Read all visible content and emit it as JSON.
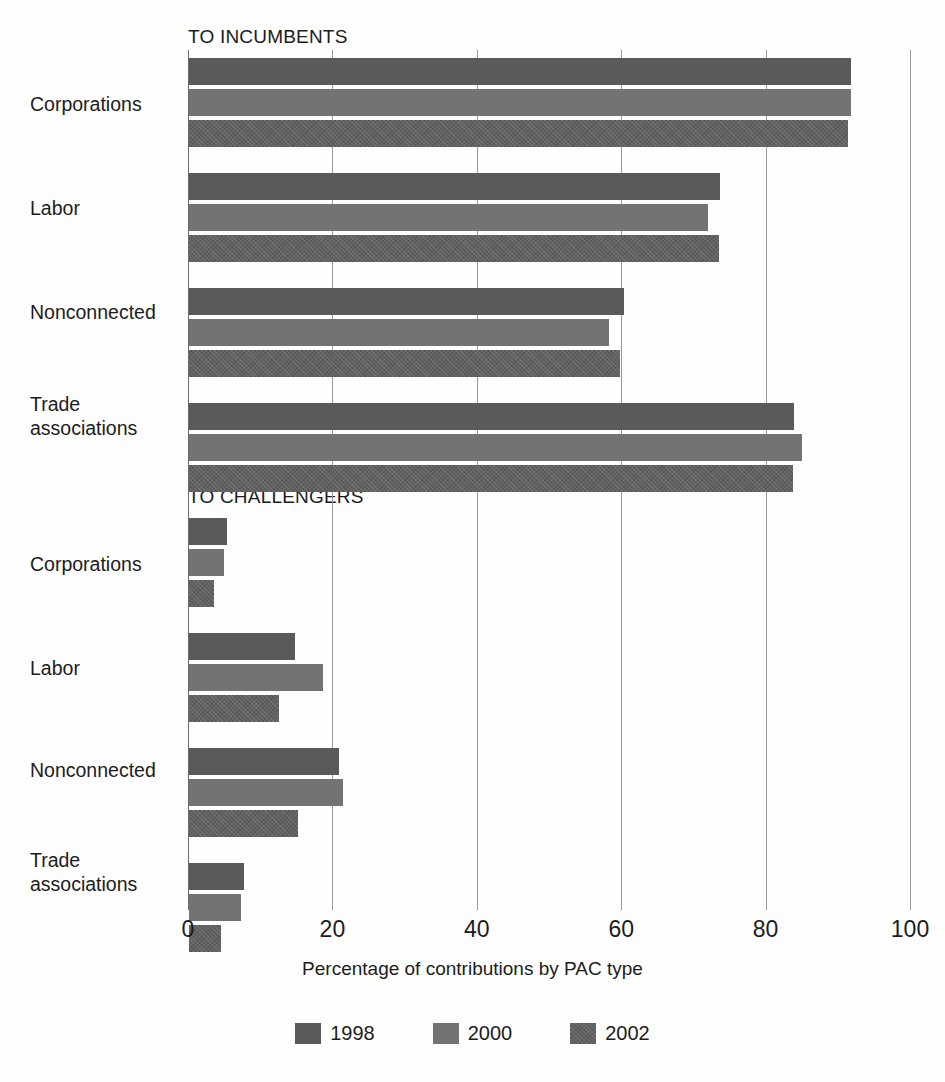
{
  "chart_data": {
    "type": "bar",
    "orientation": "horizontal",
    "title": "",
    "xlabel": "Percentage of contributions by PAC type",
    "ylabel": "",
    "xlim": [
      0,
      100
    ],
    "xticks": [
      0,
      20,
      40,
      60,
      80,
      100
    ],
    "grid": true,
    "legend_position": "bottom",
    "series": [
      {
        "name": "1998",
        "color": "#5a5a5a"
      },
      {
        "name": "2000",
        "color": "#737373"
      },
      {
        "name": "2002",
        "color": "#616161"
      }
    ],
    "panels": [
      {
        "heading": "TO INCUMBENTS",
        "categories": [
          "Corporations",
          "Labor",
          "Nonconnected",
          "Trade associations"
        ],
        "values": {
          "1998": [
            91.7,
            73.5,
            60.2,
            83.8
          ],
          "2000": [
            91.7,
            71.9,
            58.2,
            84.9
          ],
          "2002": [
            91.3,
            73.4,
            59.7,
            83.7
          ]
        }
      },
      {
        "heading": "TO CHALLENGERS",
        "categories": [
          "Corporations",
          "Labor",
          "Nonconnected",
          "Trade associations"
        ],
        "values": {
          "1998": [
            5.3,
            14.7,
            20.8,
            7.6
          ],
          "2000": [
            4.9,
            18.6,
            21.3,
            7.2
          ],
          "2002": [
            3.4,
            12.5,
            15.1,
            4.4
          ]
        }
      }
    ]
  },
  "headings": {
    "incumbents": "TO INCUMBENTS",
    "challengers": "TO CHALLENGERS"
  },
  "axis": {
    "title": "Percentage of contributions by PAC type",
    "ticks": [
      "0",
      "20",
      "40",
      "60",
      "80",
      "100"
    ]
  },
  "categories": {
    "corporations": "Corporations",
    "labor": "Labor",
    "nonconnected": "Nonconnected",
    "trade_line1": "Trade",
    "trade_line2": "associations"
  },
  "legend": {
    "items": [
      {
        "label": "1998",
        "color": "#5a5a5a"
      },
      {
        "label": "2000",
        "color": "#737373"
      },
      {
        "label": "2002",
        "color": "#616161"
      }
    ]
  }
}
